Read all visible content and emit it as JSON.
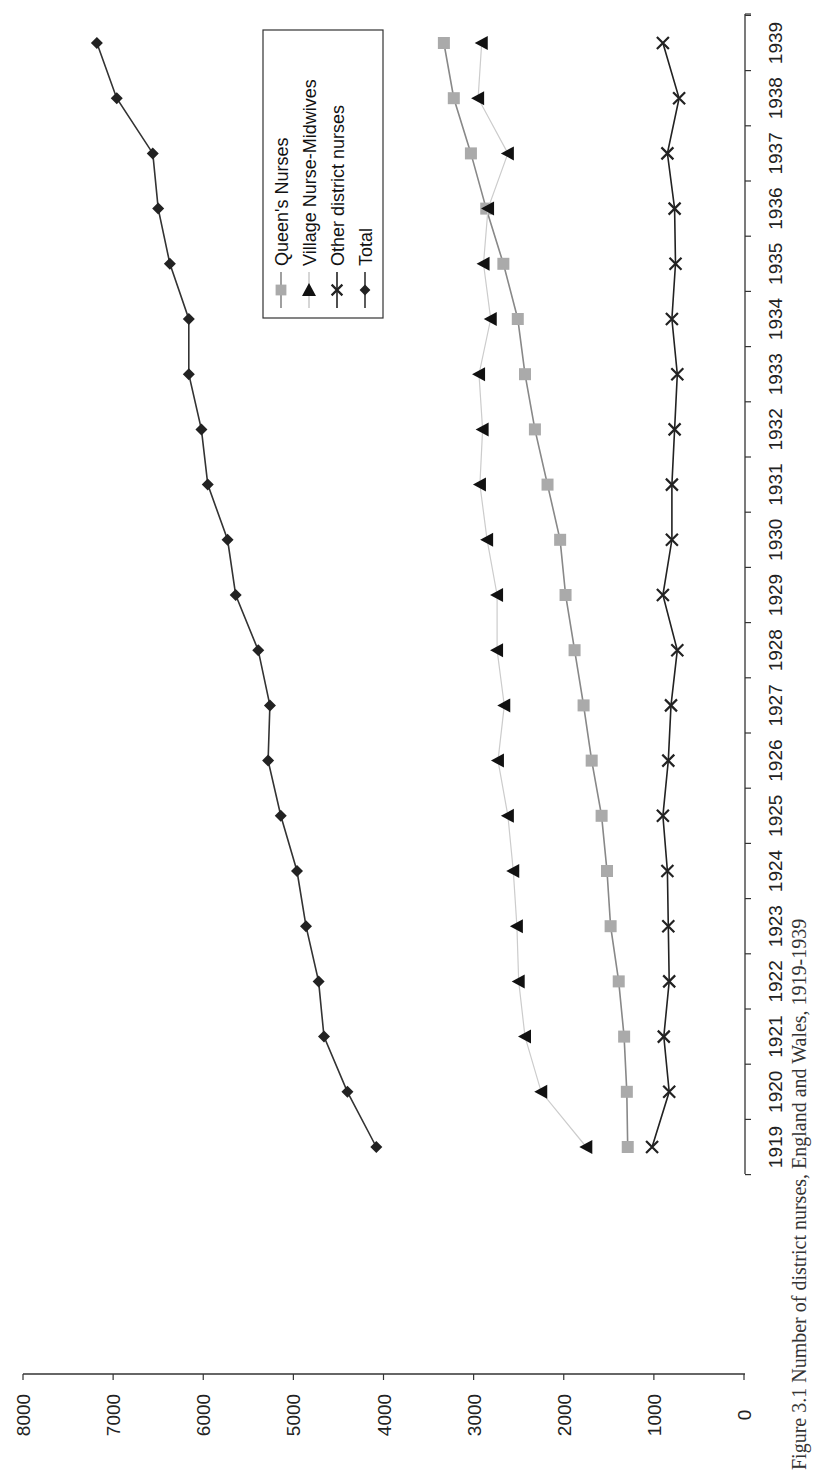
{
  "figure": {
    "caption": "Figure 3.1 Number of district nurses, England and Wales, 1919-1939"
  },
  "chart_data": {
    "type": "line",
    "orientation": "rotated 90° clockwise (years run along right edge, values along bottom)",
    "title": "",
    "caption": "Figure 3.1 Number of district nurses, England and Wales, 1919-1939",
    "xlabel": "",
    "ylabel": "",
    "ylim": [
      0,
      8000
    ],
    "yticks": [
      0,
      1000,
      2000,
      3000,
      4000,
      5000,
      6000,
      7000,
      8000
    ],
    "grid": false,
    "legend_position": "upper (inside plot, near 1936-1939 region)",
    "categories": [
      "1919",
      "1920",
      "1921",
      "1922",
      "1923",
      "1924",
      "1925",
      "1926",
      "1927",
      "1928",
      "1929",
      "1930",
      "1931",
      "1932",
      "1933",
      "1934",
      "1935",
      "1936",
      "1937",
      "1938",
      "1939"
    ],
    "series": [
      {
        "name": "Queen's Nurses",
        "marker": "square",
        "color": "#aaaaaa",
        "line_color": "#888888",
        "values": [
          1290,
          1300,
          1330,
          1390,
          1480,
          1520,
          1580,
          1690,
          1780,
          1880,
          1980,
          2040,
          2180,
          2320,
          2430,
          2510,
          2670,
          2860,
          3030,
          3220,
          3330
        ]
      },
      {
        "name": "Village Nurse-Midwives",
        "marker": "triangle",
        "color": "#111111",
        "line_color": "#cccccc",
        "values": [
          1750,
          2250,
          2430,
          2500,
          2520,
          2560,
          2620,
          2730,
          2660,
          2740,
          2740,
          2850,
          2930,
          2900,
          2940,
          2810,
          2890,
          2840,
          2620,
          2950,
          2910
        ]
      },
      {
        "name": "Other district nurses",
        "marker": "x",
        "color": "#222222",
        "line_color": "#222222",
        "values": [
          1020,
          830,
          890,
          830,
          840,
          850,
          900,
          840,
          810,
          740,
          900,
          800,
          800,
          770,
          740,
          800,
          760,
          770,
          850,
          720,
          900
        ]
      },
      {
        "name": "Total",
        "marker": "diamond",
        "color": "#222222",
        "line_color": "#333333",
        "values": [
          4080,
          4400,
          4660,
          4720,
          4860,
          4960,
          5140,
          5280,
          5260,
          5390,
          5640,
          5730,
          5950,
          6020,
          6160,
          6160,
          6370,
          6500,
          6560,
          6960,
          7180
        ]
      }
    ]
  },
  "layout": {
    "value_axis": {
      "x_at_zero": 744,
      "x_at_max": 23,
      "line_y": 1374
    },
    "category_axis": {
      "line_x": 745,
      "y_first": 1147,
      "y_last": 43,
      "top": 14,
      "bottom": 1174
    },
    "legend": {
      "x": 263,
      "y": 30,
      "w": 120,
      "h": 288
    }
  }
}
